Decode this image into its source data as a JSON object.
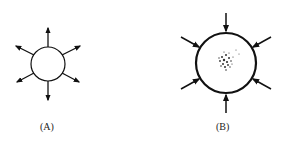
{
  "figure": {
    "panels": [
      {
        "id": "A",
        "label": "(A)",
        "description": "circle with arrows pointing outward",
        "arrow_direction": "outward",
        "arrow_count": 6,
        "has_inner_dots": false
      },
      {
        "id": "B",
        "label": "(B)",
        "description": "larger thick-outlined circle with arrows pointing inward and stippled center",
        "arrow_direction": "inward",
        "arrow_count": 6,
        "has_inner_dots": true
      }
    ],
    "colors": {
      "stroke": "#111111",
      "background": "#ffffff"
    }
  }
}
